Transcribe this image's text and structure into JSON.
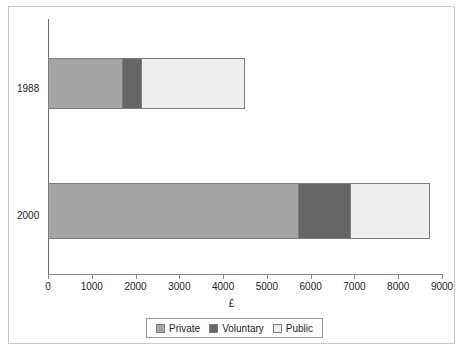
{
  "chart_data": {
    "type": "bar",
    "orientation": "horizontal",
    "stacked": true,
    "title": "",
    "xlabel": "£",
    "ylabel": "",
    "xlim": [
      0,
      9000
    ],
    "xticks": [
      0,
      1000,
      2000,
      3000,
      4000,
      5000,
      6000,
      7000,
      8000,
      9000
    ],
    "xtick_labels": [
      "0",
      "1000",
      "2000",
      "3000",
      "4000",
      "5000",
      "6000",
      "7000",
      "8000",
      "9000"
    ],
    "grid": false,
    "legend_position": "bottom",
    "categories": [
      "1988",
      "2000"
    ],
    "series": [
      {
        "name": "Private",
        "color": "#a5a5a5",
        "values": [
          1700,
          5700
        ]
      },
      {
        "name": "Voluntary",
        "color": "#666666",
        "values": [
          420,
          1200
        ]
      },
      {
        "name": "Public",
        "color": "#efefef",
        "values": [
          2350,
          1800
        ]
      }
    ],
    "totals": [
      4470,
      8700
    ]
  },
  "axis": {
    "x_title": "£",
    "ticks": [
      "0",
      "1000",
      "2000",
      "3000",
      "4000",
      "5000",
      "6000",
      "7000",
      "8000",
      "9000"
    ],
    "category_labels": [
      "1988",
      "2000"
    ]
  },
  "legend": {
    "items": [
      {
        "label": "Private",
        "color": "#a5a5a5"
      },
      {
        "label": "Voluntary",
        "color": "#666666"
      },
      {
        "label": "Public",
        "color": "#efefef"
      }
    ]
  },
  "colors": {
    "private": "#a5a5a5",
    "voluntary": "#666666",
    "public": "#efefef",
    "axis": "#8a8a8a",
    "text": "#1c1c1c",
    "frame": "#c9c9c9"
  }
}
